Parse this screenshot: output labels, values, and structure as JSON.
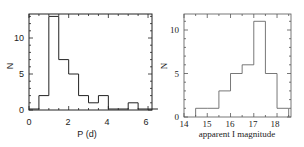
{
  "chart_data": [
    {
      "type": "bar",
      "histogram": true,
      "title": "",
      "xlabel": "P (d)",
      "ylabel": "N",
      "bin_edges": [
        0,
        0.5,
        1,
        1.5,
        2,
        2.5,
        3,
        3.5,
        4,
        4.5,
        5,
        5.5,
        6,
        6.5
      ],
      "values": [
        0,
        2,
        13,
        7,
        5,
        2,
        1,
        2,
        0,
        0,
        1,
        0,
        0
      ],
      "xlim": [
        0,
        6.2
      ],
      "ylim": [
        0,
        13.5
      ],
      "xticks": [
        "0",
        "2",
        "4",
        "6"
      ],
      "yticks": [
        "0",
        "5",
        "10"
      ],
      "grid": false,
      "legend": null
    },
    {
      "type": "bar",
      "histogram": true,
      "title": "",
      "xlabel": "apparent I magnitude",
      "ylabel": "N",
      "bin_edges": [
        14.5,
        15,
        15.5,
        16,
        16.5,
        17,
        17.5,
        18,
        18.5
      ],
      "values": [
        1,
        1,
        3,
        5,
        6,
        11,
        5,
        1
      ],
      "xlim": [
        14,
        18.6
      ],
      "ylim": [
        0,
        11.8
      ],
      "xticks": [
        "14",
        "15",
        "16",
        "17",
        "18"
      ],
      "yticks": [
        "0",
        "5",
        "10"
      ],
      "grid": false,
      "legend": null
    }
  ],
  "plots": {
    "left": {
      "ylabel": "N",
      "xlabel": "P (d)",
      "xticks": [
        "0",
        "2",
        "4",
        "6"
      ],
      "yticks": [
        "0",
        "5",
        "10"
      ]
    },
    "right": {
      "ylabel": "N",
      "xlabel": "apparent I magnitude",
      "xticks": [
        "14",
        "15",
        "16",
        "17",
        "18"
      ],
      "yticks": [
        "0",
        "5",
        "10"
      ]
    }
  }
}
